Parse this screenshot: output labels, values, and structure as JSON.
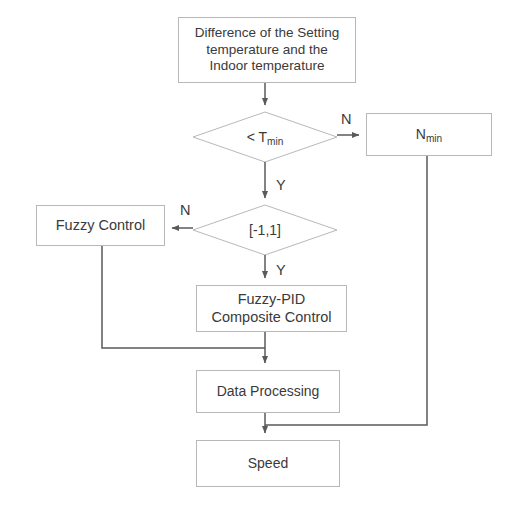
{
  "diagram": {
    "type": "flowchart",
    "colors": {
      "stroke": "#b8b8b8",
      "connector": "#5a5a5a",
      "text": "#3a3a3a",
      "background": "#ffffff"
    },
    "nodes": {
      "input": {
        "shape": "process",
        "text": "Difference of the Setting\ntemperature and the\nIndoor temperature"
      },
      "decision_tmin": {
        "shape": "decision",
        "text_prefix": "< T",
        "text_sub": "min"
      },
      "nmin": {
        "shape": "process",
        "text_prefix": "N",
        "text_sub": "min"
      },
      "decision_range": {
        "shape": "decision",
        "text": "[-1,1]"
      },
      "fuzzy_control": {
        "shape": "process",
        "text": "Fuzzy Control"
      },
      "fuzzy_pid": {
        "shape": "process",
        "text": "Fuzzy-PID\nComposite Control"
      },
      "data_processing": {
        "shape": "process",
        "text": "Data Processing"
      },
      "speed": {
        "shape": "terminator",
        "text": "Speed"
      }
    },
    "edge_labels": {
      "tmin_no": "N",
      "tmin_yes": "Y",
      "range_no": "N",
      "range_yes": "Y"
    },
    "edges": [
      {
        "from": "input",
        "to": "decision_tmin",
        "label": ""
      },
      {
        "from": "decision_tmin",
        "to": "nmin",
        "label": "N"
      },
      {
        "from": "decision_tmin",
        "to": "decision_range",
        "label": "Y"
      },
      {
        "from": "decision_range",
        "to": "fuzzy_control",
        "label": "N"
      },
      {
        "from": "decision_range",
        "to": "fuzzy_pid",
        "label": "Y"
      },
      {
        "from": "fuzzy_pid",
        "to": "data_processing",
        "label": ""
      },
      {
        "from": "fuzzy_control",
        "to": "data_processing",
        "label": ""
      },
      {
        "from": "data_processing",
        "to": "speed",
        "label": ""
      },
      {
        "from": "nmin",
        "to": "speed",
        "label": ""
      }
    ]
  }
}
